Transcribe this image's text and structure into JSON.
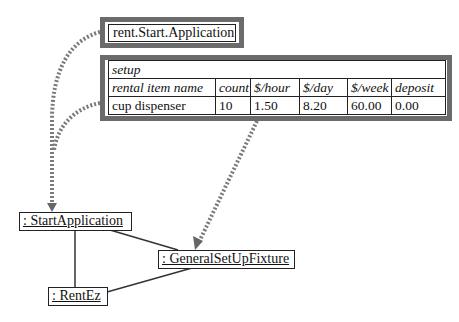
{
  "start_fixture": {
    "label": "rent.Start.Application"
  },
  "setup_table": {
    "title": "setup",
    "headers": [
      "rental item name",
      "count",
      "$/hour",
      "$/day",
      "$/week",
      "deposit"
    ],
    "rows": [
      [
        "cup dispenser",
        "10",
        "1.50",
        "8.20",
        "60.00",
        "0.00"
      ]
    ]
  },
  "objects": {
    "start_application": ": StartApplication",
    "general_setup_fixture": ": GeneralSetUpFixture",
    "rent_ez": ": RentEz"
  },
  "colors": {
    "frame": "#6b6b6b",
    "dotted_arrow": "#777777",
    "line": "#222222"
  }
}
